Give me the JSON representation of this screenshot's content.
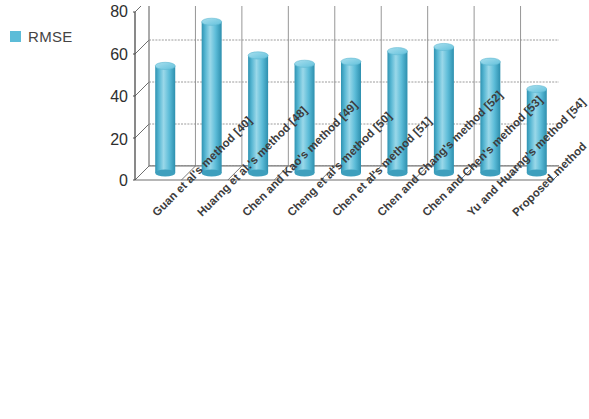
{
  "legend": {
    "label": "RMSE",
    "swatch_color": "#5cbcd8",
    "position": "left"
  },
  "axes": {
    "y_ticks": [
      "80",
      "60",
      "40",
      "20",
      "0"
    ],
    "y_min": 0,
    "y_max": 80,
    "y_step": 20,
    "grid": true
  },
  "style": {
    "bar_color": "#5cbcd8",
    "bar_color_dark": "#2f93b2",
    "bar_color_light": "#9ad8e9",
    "bar_top_color": "#7fcde2",
    "grid_color": "#8c8c8c",
    "axis_color": "#6f6f6f",
    "background": "#ffffff"
  },
  "chart_data": {
    "type": "bar",
    "title": "",
    "xlabel": "",
    "ylabel": "",
    "ylim": [
      0,
      80
    ],
    "grid": true,
    "legend_position": "left",
    "series_name": "RMSE",
    "categories": [
      "Guan et al's method   [40]",
      "Huarng et al.'s method [48]",
      "Chen and Kao's method [49]",
      "Cheng et al's method  [50]",
      "Chen et al's method   [51]",
      "Chen and Chang's method [52]",
      "Chen and Chen's method  [53]",
      "Yu and Huarng's method  [54]",
      "Proposed method"
    ],
    "values": [
      51,
      72,
      56,
      52,
      53,
      58,
      60,
      53,
      40
    ],
    "series": [
      {
        "name": "RMSE",
        "values": [
          51,
          72,
          56,
          52,
          53,
          58,
          60,
          53,
          40
        ]
      }
    ]
  }
}
